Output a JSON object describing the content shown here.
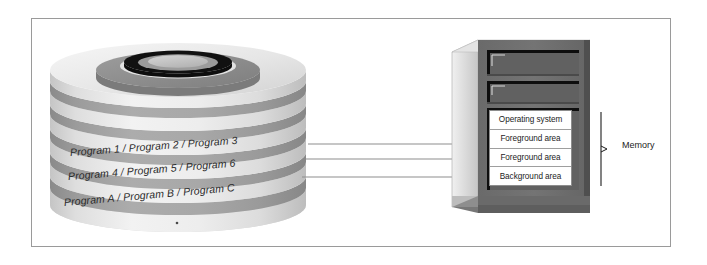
{
  "figure": {
    "disk": {
      "name": "disk-pack",
      "labels": [
        "Program 1 / Program 2 / Program 3",
        "Program 4 / Program 5 / Program 6",
        "Program A / Program B / Program C"
      ]
    },
    "computer": {
      "name": "computer-cabinet",
      "memory_rows": [
        "Operating system",
        "Foreground area",
        "Foreground area",
        "Background area"
      ],
      "bracket_label": "Memory"
    },
    "arrows": {
      "count": 3,
      "direction": "disk-to-memory"
    }
  },
  "colors": {
    "frame_border": "#9a9a9a",
    "disk_band_light": "#e9e9e9",
    "disk_band_dark": "#a3a3a3",
    "disk_ring_mid": "#8f8f8f",
    "disk_ring_inner": "#1a1a1a",
    "disk_hub": "#c9c9c9",
    "cabinet_face": "#6e6e6e",
    "cabinet_side": "#dcdcdc",
    "cabinet_slot": "#636363",
    "cabinet_dark_edge": "#111111",
    "memory_box_bg": "#ffffff",
    "arrow": "#8a8a8a",
    "arrow_head": "#000000",
    "text": "#1c1c1c"
  }
}
